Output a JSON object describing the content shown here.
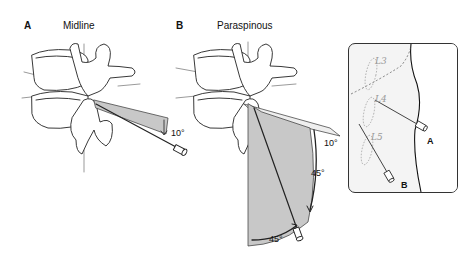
{
  "panels": [
    {
      "letter": "A",
      "title": "Midline",
      "angles": [
        "10°"
      ]
    },
    {
      "letter": "B",
      "title": "Paraspinous",
      "angles": [
        "10°",
        "45°",
        "45°"
      ]
    }
  ],
  "inset": {
    "vertebra_labels": [
      "L3",
      "L4",
      "L5"
    ],
    "needle_labels": [
      "A",
      "B"
    ]
  },
  "colors": {
    "line": "#222222",
    "shade": "#c8c8c8",
    "inset_bg": "#f4f4f4"
  }
}
